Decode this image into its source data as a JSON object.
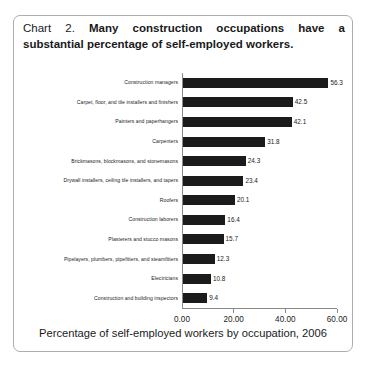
{
  "figure": {
    "title_prefix": "Chart 2.",
    "title_bold_line1": "Many construction occupations have a",
    "title_bold_line2": "substantial percentage of self-employed workers.",
    "title_full": "Chart 2. Many construction occupations have a substantial percentage of self-employed workers.",
    "caption": "Percentage of self-employed workers by occupation, 2006",
    "border_color": "#adadad",
    "bar_color": "#1b1b1b",
    "axis_color": "#8a8a8a",
    "background_color": "#ffffff"
  },
  "chart_data": {
    "type": "bar",
    "orientation": "horizontal",
    "title": "Chart 2. Many construction occupations have a substantial percentage of self-employed workers.",
    "xlabel": "Percentage of self-employed workers by occupation, 2006",
    "ylabel": "",
    "xlim": [
      0,
      60
    ],
    "xticks": [
      0,
      20,
      40,
      60
    ],
    "xticklabels": [
      "0.00",
      "20.00",
      "40.00",
      "60.00"
    ],
    "grid": false,
    "legend": false,
    "categories": [
      "Construction managers",
      "Carpet, floor, and tile installers and finishers",
      "Painters and paperhangers",
      "Carpenters",
      "Brickmasons, blockmasons, and stonemasons",
      "Drywall installers, ceiling tile installers, and tapers",
      "Roofers",
      "Construction laborers",
      "Plasterers and stucco masons",
      "Pipelayers, plumbers, pipefitters, and steamfitters",
      "Electricians",
      "Construction and building inspectors"
    ],
    "values": [
      56.3,
      42.5,
      42.1,
      31.8,
      24.3,
      23.4,
      20.1,
      16.4,
      15.7,
      12.3,
      10.8,
      9.4
    ],
    "value_labels": [
      "56.3",
      "42.5",
      "42.1",
      "31.8",
      "24.3",
      "23.4",
      "20.1",
      "16.4",
      "15.7",
      "12.3",
      "10.8",
      "9.4"
    ]
  }
}
